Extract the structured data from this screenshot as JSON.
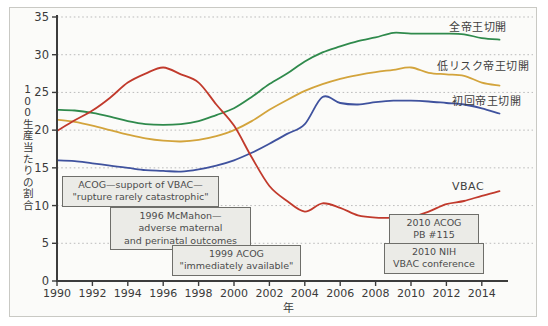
{
  "figure": {
    "background": "#fbfbf9",
    "border_color": "#c9c9c4"
  },
  "chart_data": {
    "type": "line",
    "title": "",
    "xlabel": "年",
    "ylabel": "100生産当たりの割合",
    "xlim": [
      1990,
      2015
    ],
    "ylim": [
      0,
      35
    ],
    "x_ticks": [
      1990,
      1992,
      1994,
      1996,
      1998,
      2000,
      2002,
      2004,
      2006,
      2008,
      2010,
      2012,
      2014
    ],
    "y_ticks": [
      0,
      5,
      10,
      15,
      20,
      25,
      30,
      35
    ],
    "grid": {
      "horizontal_every": 5,
      "style": "dotted"
    },
    "legend_position": "right-inline",
    "x": [
      1990,
      1991,
      1992,
      1993,
      1994,
      1995,
      1996,
      1997,
      1998,
      1999,
      2000,
      2001,
      2002,
      2003,
      2004,
      2005,
      2006,
      2007,
      2008,
      2009,
      2010,
      2011,
      2012,
      2013,
      2014,
      2015
    ],
    "series": [
      {
        "name": "全帝王切開",
        "color": "#2f8a4c",
        "label_pos": {
          "left": 449,
          "top": 18
        },
        "values": [
          22.7,
          22.6,
          22.3,
          21.8,
          21.2,
          20.8,
          20.7,
          20.8,
          21.2,
          22.0,
          22.9,
          24.4,
          26.1,
          27.5,
          29.1,
          30.3,
          31.1,
          31.8,
          32.3,
          32.9,
          32.8,
          32.8,
          32.8,
          32.7,
          32.2,
          32.0
        ]
      },
      {
        "name": "低リスク帝王切開",
        "color": "#d3a43c",
        "label_pos": {
          "left": 437,
          "top": 57
        },
        "values": [
          21.4,
          21.1,
          20.6,
          20.0,
          19.4,
          18.9,
          18.6,
          18.5,
          18.7,
          19.2,
          20.0,
          21.2,
          22.7,
          24.0,
          25.2,
          26.1,
          26.8,
          27.3,
          27.7,
          28.0,
          28.3,
          27.6,
          27.4,
          27.2,
          26.3,
          25.9
        ]
      },
      {
        "name": "初回帝王切開",
        "color": "#3f529e",
        "label_pos": {
          "left": 452,
          "top": 92
        },
        "values": [
          16.0,
          15.9,
          15.6,
          15.3,
          15.0,
          14.7,
          14.6,
          14.5,
          14.8,
          15.3,
          16.0,
          17.0,
          18.2,
          19.5,
          20.8,
          24.4,
          23.6,
          23.4,
          23.7,
          23.9,
          23.9,
          23.8,
          23.6,
          23.4,
          22.9,
          22.2
        ]
      },
      {
        "name": "VBAC",
        "color": "#c13a2c",
        "label_pos": {
          "left": 452,
          "top": 180
        },
        "values": [
          19.9,
          21.3,
          22.6,
          24.3,
          26.3,
          27.5,
          28.3,
          27.4,
          26.3,
          23.4,
          20.6,
          16.4,
          12.6,
          10.6,
          9.2,
          10.3,
          9.7,
          8.7,
          8.4,
          8.4,
          8.5,
          9.2,
          10.2,
          10.6,
          11.3,
          11.9
        ]
      }
    ],
    "annotations": [
      {
        "lines": [
          "ACOG—support of VBAC—",
          "\"rupture rarely catastrophic\""
        ],
        "pos": {
          "left": 62,
          "top": 176,
          "width": 157
        }
      },
      {
        "lines": [
          "1996 McMahon—",
          "adverse maternal",
          "and perinatal outcomes"
        ],
        "pos": {
          "left": 110,
          "top": 207,
          "width": 141
        }
      },
      {
        "lines": [
          "1999 ACOG",
          "\"immediately available\""
        ],
        "pos": {
          "left": 172,
          "top": 245,
          "width": 129
        }
      },
      {
        "lines": [
          "2010 ACOG",
          "PB #115"
        ],
        "pos": {
          "left": 389,
          "top": 214,
          "width": 90
        }
      },
      {
        "lines": [
          "2010 NIH",
          "VBAC conference"
        ],
        "pos": {
          "left": 384,
          "top": 243,
          "width": 100
        }
      }
    ],
    "axis_color": "#3c3c3c",
    "grid_color": "#bcbcbc",
    "tick_text_color": "#3a3a3a"
  }
}
